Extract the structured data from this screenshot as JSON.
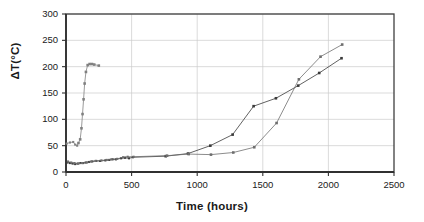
{
  "chart_data": {
    "type": "scatter",
    "title": "",
    "xlabel": "Time (hours)",
    "ylabel": "ΔT(°C)",
    "xlim": [
      0,
      2500
    ],
    "ylim": [
      0,
      300
    ],
    "xticks": [
      0,
      500,
      1000,
      1500,
      2000,
      2500
    ],
    "yticks": [
      0,
      50,
      100,
      150,
      200,
      250,
      300
    ],
    "grid": "horizontal",
    "legend": "none",
    "marker": "square",
    "series": [
      {
        "name": "rapid-rise-series",
        "color": "#808080",
        "points": [
          [
            5,
            54
          ],
          [
            30,
            56
          ],
          [
            55,
            57
          ],
          [
            70,
            52
          ],
          [
            85,
            50
          ],
          [
            95,
            55
          ],
          [
            108,
            62
          ],
          [
            118,
            83
          ],
          [
            126,
            110
          ],
          [
            134,
            138
          ],
          [
            142,
            168
          ],
          [
            152,
            190
          ],
          [
            165,
            203
          ],
          [
            180,
            205
          ],
          [
            198,
            205
          ],
          [
            215,
            204
          ],
          [
            250,
            202
          ]
        ]
      },
      {
        "name": "slow-rise-series-upper",
        "color": "#3a3a3a",
        "points": [
          [
            10,
            18
          ],
          [
            30,
            17
          ],
          [
            50,
            16
          ],
          [
            70,
            15
          ],
          [
            90,
            16
          ],
          [
            110,
            17
          ],
          [
            130,
            17
          ],
          [
            150,
            18
          ],
          [
            175,
            19
          ],
          [
            200,
            20
          ],
          [
            230,
            21
          ],
          [
            260,
            21
          ],
          [
            300,
            22
          ],
          [
            330,
            23
          ],
          [
            355,
            24
          ],
          [
            380,
            24
          ],
          [
            420,
            26
          ],
          [
            450,
            27
          ],
          [
            480,
            26
          ],
          [
            510,
            28
          ],
          [
            760,
            30
          ],
          [
            930,
            35
          ],
          [
            1100,
            50
          ],
          [
            1270,
            71
          ],
          [
            1430,
            125
          ],
          [
            1600,
            140
          ],
          [
            1770,
            164
          ],
          [
            1930,
            188
          ],
          [
            2100,
            216
          ]
        ]
      },
      {
        "name": "slow-rise-series-lower",
        "color": "#6e6e6e",
        "points": [
          [
            15,
            20
          ],
          [
            40,
            18
          ],
          [
            65,
            17
          ],
          [
            95,
            16
          ],
          [
            125,
            17
          ],
          [
            160,
            18
          ],
          [
            190,
            20
          ],
          [
            225,
            21
          ],
          [
            270,
            22
          ],
          [
            310,
            23
          ],
          [
            345,
            24
          ],
          [
            390,
            25
          ],
          [
            435,
            28
          ],
          [
            470,
            29
          ],
          [
            515,
            29
          ],
          [
            770,
            31
          ],
          [
            935,
            34
          ],
          [
            1105,
            33
          ],
          [
            1275,
            37
          ],
          [
            1435,
            47
          ],
          [
            1605,
            93
          ],
          [
            1775,
            176
          ],
          [
            1940,
            219
          ],
          [
            2105,
            242
          ]
        ]
      }
    ]
  },
  "axes": {
    "x_tick_labels": [
      "0",
      "500",
      "1000",
      "1500",
      "2000",
      "2500"
    ],
    "y_tick_labels": [
      "0",
      "50",
      "100",
      "150",
      "200",
      "250",
      "300"
    ]
  },
  "style": {
    "frame_color": "#404040",
    "grid_color": "#cccccc",
    "background": "#ffffff"
  }
}
